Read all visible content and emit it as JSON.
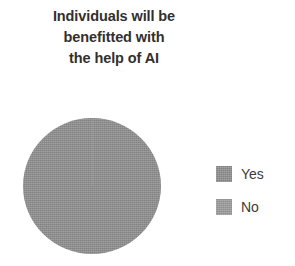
{
  "chart_data": {
    "type": "pie",
    "title": "Individuals will be benefitted with the help of AI",
    "title_lines": [
      "Individuals will be",
      "benefitted with",
      "the help of AI"
    ],
    "categories": [
      "Yes",
      "No"
    ],
    "values": [
      100,
      0
    ],
    "value_unit": "%",
    "legend": [
      {
        "label": "Yes",
        "color": "#8f8f8f",
        "value": 100
      },
      {
        "label": "No",
        "color": "#9c9c9c",
        "value": 0
      }
    ],
    "legend_position": "right",
    "data_labels": false,
    "grid": false,
    "start_angle": 0,
    "xlabel": "",
    "ylabel": ""
  },
  "colors": {
    "title_text": "#332f2e",
    "legend_text": "#3b3b3b",
    "slice_yes": "#8f8f8f",
    "slice_no": "#9c9c9c",
    "background": "#ffffff"
  }
}
